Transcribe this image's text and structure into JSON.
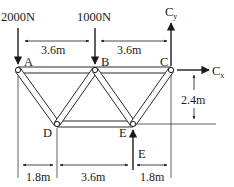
{
  "diagram": {
    "type": "truss",
    "colors": {
      "line": "#2a2a2a",
      "member_fill": "#ffffff",
      "background": "#ffffff"
    },
    "joints": [
      {
        "id": "A",
        "label": "A",
        "x": 18,
        "y": 70
      },
      {
        "id": "B",
        "label": "B",
        "x": 95,
        "y": 70
      },
      {
        "id": "C",
        "label": "C",
        "x": 171,
        "y": 70
      },
      {
        "id": "D",
        "label": "D",
        "x": 57,
        "y": 124
      },
      {
        "id": "E",
        "label": "E",
        "x": 133,
        "y": 124
      }
    ],
    "members": [
      "A-B",
      "B-C",
      "A-D",
      "D-B",
      "B-E",
      "E-C",
      "D-E"
    ],
    "loads": [
      {
        "id": "load-A",
        "label": "2000N",
        "at": "A",
        "direction": "down"
      },
      {
        "id": "load-B",
        "label": "1000N",
        "at": "B",
        "direction": "down"
      }
    ],
    "reactions": [
      {
        "id": "Cy",
        "label": "C",
        "subscript": "y",
        "at": "C",
        "direction": "up"
      },
      {
        "id": "Cx",
        "label": "C",
        "subscript": "x",
        "at": "C",
        "direction": "right"
      },
      {
        "id": "Ey",
        "label": "E",
        "at": "E",
        "direction": "up"
      }
    ],
    "dimensions": {
      "top_left": "3.6m",
      "top_right": "3.6m",
      "height": "2.4m",
      "bottom_left": "1.8m",
      "bottom_middle": "3.6m",
      "bottom_right": "1.8m"
    },
    "text": {
      "load_A": "2000N",
      "load_B": "1000N",
      "joint_A": "A",
      "joint_B": "B",
      "joint_C": "C",
      "joint_D": "D",
      "joint_E": "E",
      "reaction_Cy_main": "C",
      "reaction_Cy_sub": "y",
      "reaction_Cx_main": "C",
      "reaction_Cx_sub": "x",
      "reaction_E": "E"
    }
  }
}
